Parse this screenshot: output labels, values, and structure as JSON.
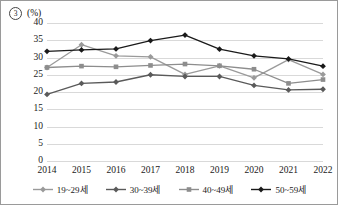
{
  "header": {
    "index_marker": "3",
    "unit_label": "(%)"
  },
  "chart_data": {
    "type": "line",
    "title": "",
    "xlabel": "",
    "ylabel": "(%)",
    "ylim": [
      0,
      40
    ],
    "ytick_step": 5,
    "yticks": [
      "40",
      "35",
      "30",
      "25",
      "20",
      "15",
      "10",
      "5",
      "0"
    ],
    "grid": true,
    "legend_position": "bottom",
    "categories": [
      "2014",
      "2015",
      "2016",
      "2017",
      "2018",
      "2019",
      "2020",
      "2021",
      "2022"
    ],
    "series": [
      {
        "name": "19~29세",
        "color": "#9a9a9a",
        "marker": "diamond",
        "values": [
          27.1,
          33.7,
          30.5,
          30.2,
          25.1,
          27.6,
          24.1,
          29.4,
          25.1
        ]
      },
      {
        "name": "30~39세",
        "color": "#5a5a5a",
        "marker": "diamond",
        "values": [
          19.3,
          22.5,
          22.9,
          25.0,
          24.5,
          24.5,
          21.9,
          20.6,
          20.8
        ]
      },
      {
        "name": "40~49세",
        "color": "#8d8d8d",
        "marker": "square",
        "values": [
          27.1,
          27.5,
          27.3,
          27.7,
          28.1,
          27.6,
          26.6,
          22.5,
          23.6
        ]
      },
      {
        "name": "50~59세",
        "color": "#1a1a1a",
        "marker": "diamond",
        "values": [
          31.8,
          32.2,
          32.5,
          34.9,
          36.5,
          32.4,
          30.5,
          29.6,
          27.5
        ]
      }
    ]
  }
}
